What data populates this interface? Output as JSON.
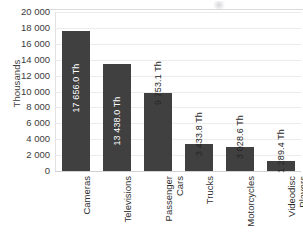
{
  "chart_data": {
    "type": "bar",
    "title": "",
    "xlabel": "",
    "ylabel": "Thousands",
    "ylim": [
      0,
      20000
    ],
    "ytick_step": 2000,
    "grid": true,
    "legend": "none",
    "orientation": "vertical",
    "bar_color": "#404040",
    "categories": [
      "Cameras",
      "Televisions",
      "Passenger Cars",
      "Trucks",
      "Motorcycles",
      "Videodisc Players"
    ],
    "values": [
      17656.0,
      13438.0,
      9753.1,
      3433.8,
      3028.6,
      1289.4
    ],
    "data_labels": [
      "17 656.0 Th",
      "13 438.0 Th",
      "9 753.1 Th",
      "3 433.8 Th",
      "3 028.6 Th",
      "1 289.4 Th"
    ],
    "ytick_labels": [
      "20 000",
      "18 000",
      "16 000",
      "14 000",
      "12 000",
      "10 000",
      "8 000",
      "6 000",
      "4 000",
      "2 000",
      "0"
    ]
  },
  "categories_wrapped": [
    {
      "line1": "Cameras",
      "line2": ""
    },
    {
      "line1": "Televisions",
      "line2": ""
    },
    {
      "line1": "Passenger",
      "line2": "Cars"
    },
    {
      "line1": "Trucks",
      "line2": ""
    },
    {
      "line1": "Motorcycles",
      "line2": ""
    },
    {
      "line1": "Videodisc",
      "line2": "Players"
    }
  ]
}
